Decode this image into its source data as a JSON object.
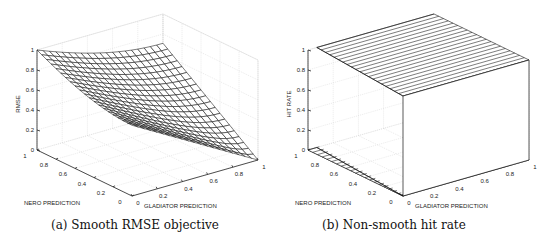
{
  "chart_data": [
    {
      "type": "surface",
      "title": "",
      "caption": "(a) Smooth RMSE objective",
      "xlabel": "GLADIATOR PREDICTION",
      "ylabel": "NERO PREDICTION",
      "zlabel": "RMSE",
      "xlim": [
        0,
        1
      ],
      "ylim": [
        0,
        1
      ],
      "zlim": [
        0,
        1
      ],
      "xticks": [
        "0",
        "0.2",
        "0.4",
        "0.6",
        "0.8",
        "1"
      ],
      "yticks": [
        "0",
        "0.2",
        "0.4",
        "0.6",
        "0.8",
        "1"
      ],
      "zticks": [
        "0",
        "0.2",
        "0.4",
        "0.6",
        "0.8",
        "1"
      ],
      "grid": true,
      "grid_resolution": 20,
      "corner_values": {
        "nero0_glad0": 0.71,
        "nero1_glad0": 1.0,
        "nero0_glad1": 0.02,
        "nero1_glad1": 0.71
      },
      "description": "Smooth convex surface: RMSE is 1 at Nero=1,Gladiator=0 and falls to ~0 at Nero=0,Gladiator=1"
    },
    {
      "type": "surface",
      "title": "",
      "caption": "(b) Non-smooth hit rate",
      "xlabel": "GLADIATOR PREDICTION",
      "ylabel": "NERO PREDICTION",
      "zlabel": "HIT RATE",
      "xlim": [
        0,
        1
      ],
      "ylim": [
        0,
        1
      ],
      "zlim": [
        0,
        1
      ],
      "xticks": [
        "0",
        "0.2",
        "0.4",
        "0.6",
        "0.8",
        "1"
      ],
      "yticks": [
        "0",
        "0.2",
        "0.4",
        "0.6",
        "0.8",
        "1"
      ],
      "zticks": [
        "0",
        "0.2",
        "0.4",
        "0.6",
        "0.8",
        "1"
      ],
      "grid": true,
      "description": "Step function: hit rate is 0 for Gladiator prediction below the threshold and jumps to 1 above it"
    }
  ],
  "captions": {
    "a": "(a) Smooth RMSE objective",
    "b": "(b) Non-smooth hit rate"
  },
  "labels": {
    "left_z": "RMSE",
    "right_z": "HIT RATE",
    "nero": "NERO PREDICTION",
    "gladiator": "GLADIATOR PREDICTION"
  }
}
